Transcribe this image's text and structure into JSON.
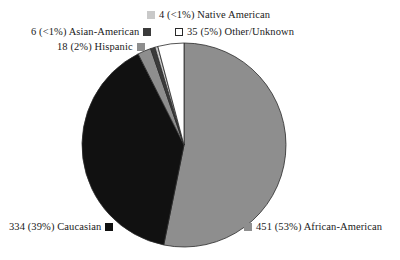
{
  "chart_data": {
    "type": "pie",
    "title": "",
    "categories": [
      "African-American",
      "Caucasian",
      "Hispanic",
      "Asian-American",
      "Native American",
      "Other/Unknown"
    ],
    "values": [
      451,
      334,
      18,
      6,
      4,
      35
    ],
    "percent_labels": [
      "53%",
      "39%",
      "2%",
      "<1%",
      "<1%",
      "5%"
    ],
    "percents": [
      53,
      39,
      2,
      0.7,
      0.5,
      5
    ],
    "total": 848,
    "colors": [
      "#8e8e8e",
      "#111111",
      "#8e8e8e",
      "#3b3b3b",
      "#c9c9c9",
      "#ffffff"
    ],
    "start_angle_deg": 0,
    "direction": "clockwise",
    "grid": false,
    "legend_position": "around-slices",
    "xlabel": "",
    "ylabel": ""
  },
  "slices": [
    {
      "id": "african-american",
      "count": "451",
      "percent": "(53%)",
      "name": "African-American",
      "text": "451 (53%) African-American",
      "color": "#8e8e8e",
      "swatch": "swatch-african-american",
      "swatch_side": "left"
    },
    {
      "id": "caucasian",
      "count": "334",
      "percent": "(39%)",
      "name": "Caucasian",
      "text": "334 (39%) Caucasian",
      "color": "#111111",
      "swatch": "swatch-caucasian",
      "swatch_side": "right"
    },
    {
      "id": "hispanic",
      "count": "18",
      "percent": "(2%)",
      "name": "Hispanic",
      "text": "18 (2%) Hispanic",
      "color": "#8e8e8e",
      "swatch": "swatch-hispanic",
      "swatch_side": "right"
    },
    {
      "id": "asian-american",
      "count": "6",
      "percent": "(<1%)",
      "name": "Asian-American",
      "text": "6 (<1%) Asian-American",
      "color": "#3b3b3b",
      "swatch": "swatch-asian-american",
      "swatch_side": "right"
    },
    {
      "id": "native-american",
      "count": "4",
      "percent": "(<1%)",
      "name": "Native American",
      "text": "4 (<1%) Native American",
      "color": "#c9c9c9",
      "swatch": "swatch-native-american",
      "swatch_side": "left"
    },
    {
      "id": "other-unknown",
      "count": "35",
      "percent": "(5%)",
      "name": "Other/Unknown",
      "text": "35 (5%) Other/Unknown",
      "color": "#ffffff",
      "swatch": "swatch-other-unknown",
      "swatch_side": "left"
    }
  ]
}
